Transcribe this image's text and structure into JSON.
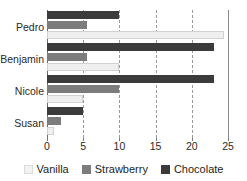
{
  "chart_data": {
    "type": "bar",
    "orientation": "horizontal",
    "title": "",
    "xlabel": "",
    "ylabel": "",
    "categories": [
      "Pedro",
      "Benjamin",
      "Nicole",
      "Susan"
    ],
    "series": [
      {
        "name": "Vanilla",
        "color": "#efefef",
        "values": [
          24.5,
          10,
          5,
          1
        ]
      },
      {
        "name": "Strawberry",
        "color": "#7c7c7c",
        "values": [
          5.5,
          5.5,
          10,
          2
        ]
      },
      {
        "name": "Chocolate",
        "color": "#3b3b3b",
        "values": [
          10,
          23,
          23,
          5
        ]
      }
    ],
    "xlim": [
      0,
      25
    ],
    "xticks": [
      0,
      5,
      10,
      15,
      20,
      25
    ],
    "xtick_labels": [
      "0",
      "5",
      "10",
      "15",
      "20",
      "25"
    ],
    "grid": true,
    "grid_axis": "x",
    "legend_position": "bottom"
  },
  "axis": {
    "ticks": [
      {
        "value": 0,
        "label": "0"
      },
      {
        "value": 5,
        "label": "5"
      },
      {
        "value": 10,
        "label": "10"
      },
      {
        "value": 15,
        "label": "15"
      },
      {
        "value": 20,
        "label": "20"
      },
      {
        "value": 25,
        "label": "25"
      }
    ]
  },
  "groups": [
    {
      "label": "Pedro",
      "chocolate": 10,
      "strawberry": 5.5,
      "vanilla": 24.5
    },
    {
      "label": "Benjamin",
      "chocolate": 23,
      "strawberry": 5.5,
      "vanilla": 10
    },
    {
      "label": "Nicole",
      "chocolate": 23,
      "strawberry": 10,
      "vanilla": 5
    },
    {
      "label": "Susan",
      "chocolate": 5,
      "strawberry": 2,
      "vanilla": 1
    }
  ],
  "legend": {
    "items": [
      {
        "label": "Vanilla",
        "swatch": "vanilla-swatch"
      },
      {
        "label": "Strawberry",
        "swatch": "strawberry-swatch"
      },
      {
        "label": "Chocolate",
        "swatch": "chocolate-swatch"
      }
    ]
  }
}
